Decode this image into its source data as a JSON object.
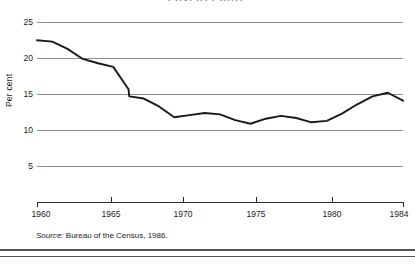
{
  "figure": {
    "title": "POVERTY RATE",
    "source_prefix": "Source:",
    "source_text": " Bureau of the Census, 1986."
  },
  "axes": {
    "y_title": "Per cent",
    "y_ticks": [
      "25",
      "20",
      "15",
      "10",
      "5"
    ],
    "x_ticks": [
      "1960",
      "1965",
      "1970",
      "1975",
      "1980",
      "1984"
    ]
  },
  "chart_data": {
    "type": "line",
    "title": "POVERTY RATE",
    "xlabel": "",
    "ylabel": "Per cent",
    "xlim": [
      1960,
      1984
    ],
    "ylim": [
      0,
      26
    ],
    "y_ticks": [
      5,
      10,
      15,
      20,
      25
    ],
    "x_ticks": [
      1960,
      1965,
      1970,
      1975,
      1980,
      1984
    ],
    "grid": "horizontal",
    "legend": "none",
    "line_color": "#1a1a1a",
    "x": [
      1960,
      1961,
      1962,
      1963,
      1964,
      1965,
      1966,
      1966.05,
      1967,
      1968,
      1969,
      1970,
      1971,
      1972,
      1973,
      1974,
      1975,
      1976,
      1977,
      1978,
      1979,
      1980,
      1981,
      1982,
      1983,
      1984
    ],
    "values": [
      22.4,
      22.2,
      21.2,
      19.8,
      19.2,
      18.7,
      15.6,
      14.6,
      14.3,
      13.2,
      11.7,
      12.0,
      12.3,
      12.1,
      11.3,
      10.8,
      11.5,
      11.9,
      11.6,
      11.0,
      11.2,
      12.2,
      13.5,
      14.6,
      15.1,
      14.0
    ]
  }
}
